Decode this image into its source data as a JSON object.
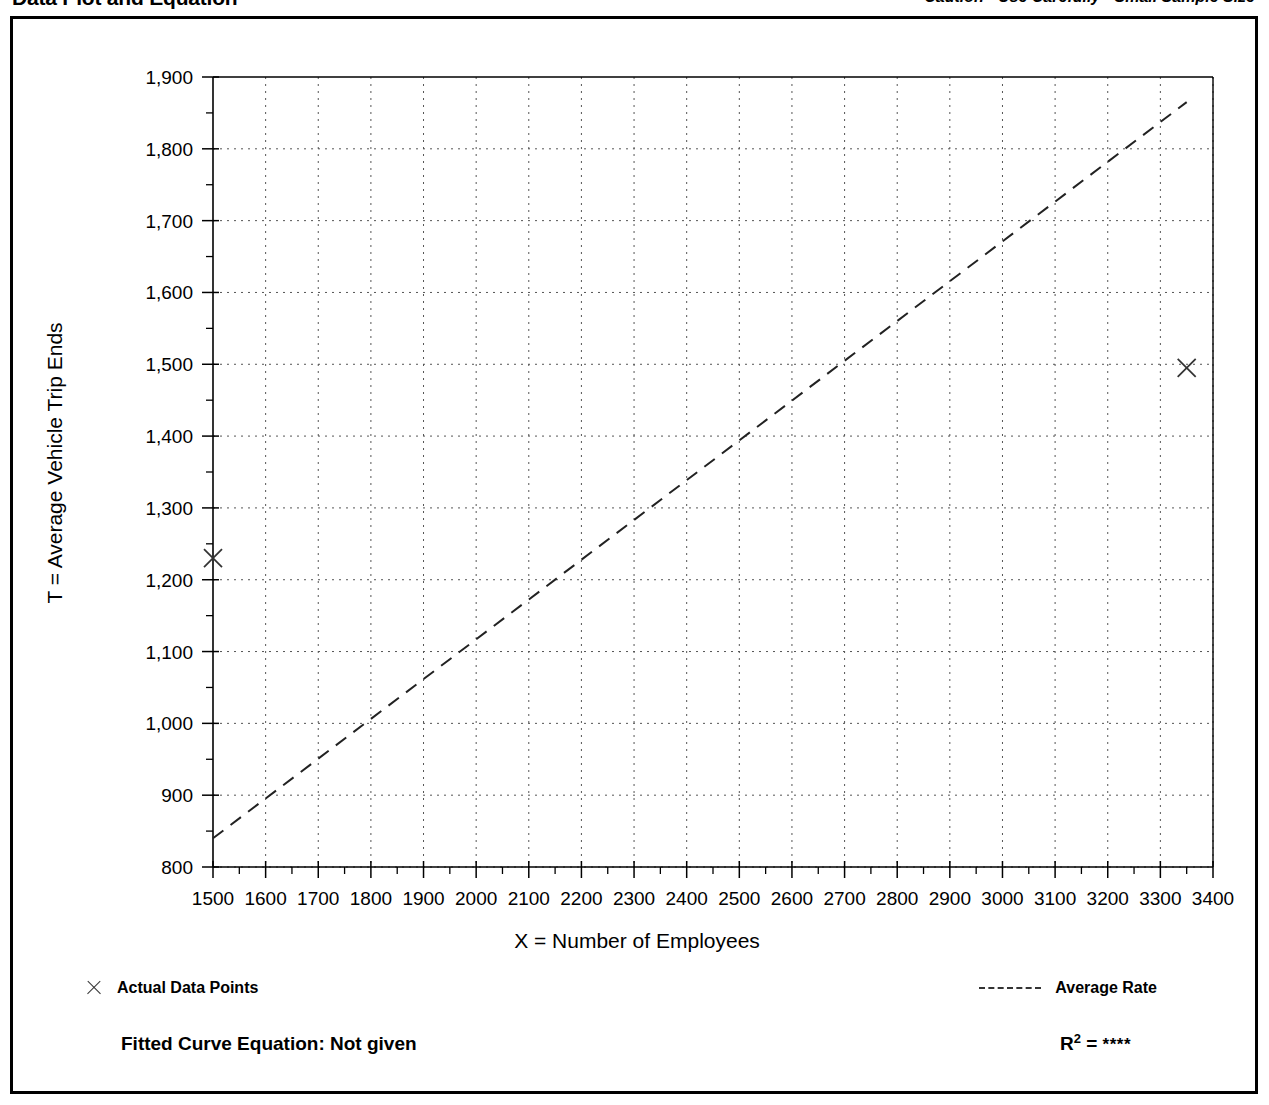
{
  "header": {
    "title": "Data Plot and Equation",
    "caution": "Caution - Use Carefully - Small Sample Size"
  },
  "legend": {
    "data_points_label": "Actual Data Points",
    "average_rate_label": "Average Rate",
    "x_marker_icon": "x-marker-icon",
    "dashed-line-icon": "dashed-line-icon"
  },
  "footer": {
    "fitted_equation": "Fitted Curve Equation:  Not given",
    "r_label": "R",
    "r_exponent": "2",
    "r_equals": " = ",
    "r_value": "****"
  },
  "chart_data": {
    "type": "scatter",
    "title": "Data Plot and Equation",
    "subtitle": "Caution - Use Carefully - Small Sample Size",
    "xlabel": "X = Number of Employees",
    "ylabel": "T = Average Vehicle Trip Ends",
    "xlim": [
      1500,
      3400
    ],
    "ylim": [
      800,
      1900
    ],
    "xticks": [
      1500,
      1600,
      1700,
      1800,
      1900,
      2000,
      2100,
      2200,
      2300,
      2400,
      2500,
      2600,
      2700,
      2800,
      2900,
      3000,
      3100,
      3200,
      3300,
      3400
    ],
    "xtick_labels": [
      "1500",
      "1600",
      "1700",
      "1800",
      "1900",
      "2000",
      "2100",
      "2200",
      "2300",
      "2400",
      "2500",
      "2600",
      "2700",
      "2800",
      "2900",
      "3000",
      "3100",
      "3200",
      "3300",
      "3400"
    ],
    "yticks": [
      800,
      900,
      1000,
      1100,
      1200,
      1300,
      1400,
      1500,
      1600,
      1700,
      1800,
      1900
    ],
    "ytick_labels": [
      "800",
      "900",
      "1,000",
      "1,100",
      "1,200",
      "1,300",
      "1,400",
      "1,500",
      "1,600",
      "1,700",
      "1,800",
      "1,900"
    ],
    "y_minor_ticks": [
      850,
      950,
      1050,
      1150,
      1250,
      1350,
      1450,
      1550,
      1650,
      1750,
      1850
    ],
    "x_minor_ticks": [
      1550,
      1650,
      1750,
      1850,
      1950,
      2050,
      2150,
      2250,
      2350,
      2450,
      2550,
      2650,
      2750,
      2850,
      2950,
      3050,
      3150,
      3250,
      3350
    ],
    "grid": true,
    "grid_style": "dotted",
    "legend_position": "below-plot",
    "series": [
      {
        "name": "Actual Data Points",
        "type": "scatter",
        "marker": "x",
        "points": [
          {
            "x": 1500,
            "y": 1230
          },
          {
            "x": 3350,
            "y": 1495
          }
        ]
      },
      {
        "name": "Average Rate",
        "type": "line",
        "style": "dashed",
        "points": [
          {
            "x": 1500,
            "y": 840
          },
          {
            "x": 3350,
            "y": 1865
          }
        ]
      }
    ]
  }
}
